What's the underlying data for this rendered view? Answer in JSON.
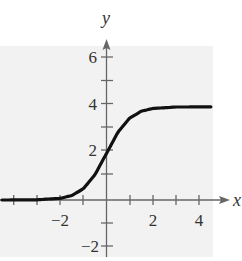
{
  "chart_data": {
    "type": "line",
    "title": "",
    "xlabel": "x",
    "ylabel": "y",
    "xlim": [
      -4.5,
      4.7
    ],
    "ylim": [
      -2.5,
      6.6
    ],
    "x_ticks": [
      -4,
      -3,
      -2,
      -1,
      0,
      1,
      2,
      3,
      4
    ],
    "x_tick_labels": [
      "-2",
      "2",
      "4"
    ],
    "y_ticks": [
      -2,
      -1,
      1,
      2,
      3,
      4,
      5,
      6
    ],
    "y_tick_labels": [
      "-2",
      "2",
      "4",
      "6"
    ],
    "grid": false,
    "background": "#f2f2f2",
    "series": [
      {
        "name": "f(x)",
        "description": "logistic curve approaching 0 on left and 4 on right, passing through (0, 2)",
        "x": [
          -4.5,
          -3,
          -2,
          -1.5,
          -1,
          -0.5,
          0,
          0.5,
          1,
          1.5,
          2,
          3,
          4.5
        ],
        "y": [
          0.0,
          0.01,
          0.07,
          0.19,
          0.48,
          1.08,
          2.0,
          2.92,
          3.52,
          3.81,
          3.93,
          3.99,
          4.0
        ]
      }
    ]
  },
  "labels": {
    "x_axis": "x",
    "y_axis": "y",
    "x_tick_neg2": "−2",
    "x_tick_2": "2",
    "x_tick_4": "4",
    "y_tick_neg2": "−2",
    "y_tick_2": "2",
    "y_tick_4": "4",
    "y_tick_6": "6"
  }
}
